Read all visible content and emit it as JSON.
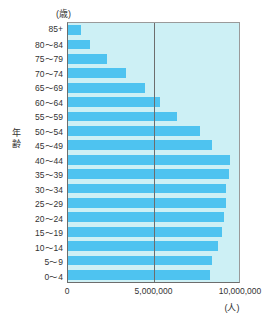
{
  "chart_data": {
    "type": "bar",
    "orientation": "horizontal",
    "title": "",
    "xlabel": "(人)",
    "ylabel": "年齢",
    "y_unit": "(歳)",
    "categories": [
      "85+",
      "80〜84",
      "75〜79",
      "70〜74",
      "65〜69",
      "60〜64",
      "55〜59",
      "50〜54",
      "45〜49",
      "40〜44",
      "35〜39",
      "30〜34",
      "25〜29",
      "20〜24",
      "15〜19",
      "10〜14",
      "5〜9",
      "0〜4"
    ],
    "values": [
      750000,
      1300000,
      2300000,
      3400000,
      4500000,
      5400000,
      6400000,
      7700000,
      8450000,
      9500000,
      9400000,
      9250000,
      9250000,
      9100000,
      9000000,
      8800000,
      8450000,
      8300000
    ],
    "xlim": [
      0,
      10000000
    ],
    "xticks": [
      0,
      5000000,
      10000000
    ],
    "xtick_labels": [
      "0",
      "5,000,000",
      "10,000,000"
    ],
    "grid": true,
    "legend": false,
    "bar_color": "#4ec3f0",
    "plot_background": "#cdf0f5",
    "axis_color": "#6d6d6d"
  }
}
